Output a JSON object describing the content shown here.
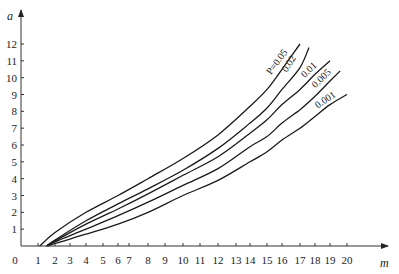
{
  "chart_data": {
    "type": "line",
    "title": "",
    "xlabel": "m",
    "ylabel": "a",
    "xlim": [
      0,
      20
    ],
    "ylim": [
      0,
      12
    ],
    "grid": false,
    "legend": "inline curve labels (top-right)",
    "x_ticks": [
      "0",
      "1",
      "2",
      "3",
      "4",
      "5",
      "6",
      "7",
      "8",
      "9",
      "10",
      "11",
      "12",
      "13",
      "14",
      "15",
      "16",
      "17",
      "18",
      "19",
      "20"
    ],
    "y_ticks": [
      "1",
      "2",
      "3",
      "4",
      "5",
      "6",
      "7",
      "8",
      "9",
      "10",
      "11",
      "12"
    ],
    "series": [
      {
        "name": "P=0.05",
        "label": "P=0.05",
        "points": [
          [
            1.1,
            0
          ],
          [
            2,
            0.8
          ],
          [
            4,
            2.0
          ],
          [
            6,
            3.0
          ],
          [
            8,
            4.0
          ],
          [
            10,
            5.2
          ],
          [
            12,
            6.6
          ],
          [
            14,
            8.3
          ],
          [
            15,
            9.3
          ],
          [
            16,
            10.5
          ],
          [
            17,
            12.0
          ]
        ]
      },
      {
        "name": "0.02",
        "label": "0.02",
        "points": [
          [
            1.5,
            0
          ],
          [
            2,
            0.35
          ],
          [
            4,
            1.5
          ],
          [
            6,
            2.5
          ],
          [
            8,
            3.4
          ],
          [
            10,
            4.5
          ],
          [
            12,
            5.8
          ],
          [
            14,
            7.3
          ],
          [
            15,
            8.2
          ],
          [
            16,
            9.3
          ],
          [
            17,
            10.6
          ],
          [
            17.6,
            11.8
          ]
        ]
      },
      {
        "name": "0.01",
        "label": "0.01",
        "points": [
          [
            1.5,
            0
          ],
          [
            2,
            0.3
          ],
          [
            4,
            1.3
          ],
          [
            6,
            2.2
          ],
          [
            8,
            3.1
          ],
          [
            10,
            4.2
          ],
          [
            12,
            5.3
          ],
          [
            14,
            6.7
          ],
          [
            15,
            7.5
          ],
          [
            16,
            8.4
          ],
          [
            17,
            9.3
          ],
          [
            18,
            10.2
          ],
          [
            19,
            11.0
          ]
        ]
      },
      {
        "name": "0.005",
        "label": "0.005",
        "points": [
          [
            1.5,
            0
          ],
          [
            2,
            0.25
          ],
          [
            4,
            1.0
          ],
          [
            6,
            1.8
          ],
          [
            8,
            2.6
          ],
          [
            10,
            3.6
          ],
          [
            12,
            4.6
          ],
          [
            14,
            5.9
          ],
          [
            15,
            6.5
          ],
          [
            16,
            7.3
          ],
          [
            17,
            8.1
          ],
          [
            18,
            8.9
          ],
          [
            19,
            9.8
          ],
          [
            19.6,
            10.4
          ]
        ]
      },
      {
        "name": "0.001",
        "label": "0.001",
        "points": [
          [
            1.6,
            0
          ],
          [
            2,
            0.15
          ],
          [
            4,
            0.7
          ],
          [
            6,
            1.3
          ],
          [
            8,
            2.0
          ],
          [
            10,
            3.0
          ],
          [
            12,
            3.9
          ],
          [
            14,
            5.0
          ],
          [
            15,
            5.6
          ],
          [
            16,
            6.3
          ],
          [
            17,
            7.0
          ],
          [
            18,
            7.7
          ],
          [
            19,
            8.4
          ],
          [
            20,
            9.0
          ]
        ]
      }
    ]
  }
}
